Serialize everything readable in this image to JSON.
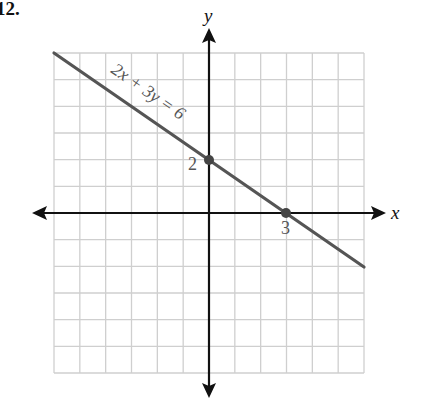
{
  "problem": {
    "number_label": "12."
  },
  "chart_data": {
    "type": "line",
    "title": "",
    "xlabel": "x",
    "ylabel": "y",
    "xlim": [
      -6,
      6
    ],
    "ylim": [
      -6,
      6
    ],
    "grid": true,
    "grid_step": 1,
    "equation": "2x + 3y = 6",
    "series": [
      {
        "name": "2x + 3y = 6",
        "x": [
          -6,
          6
        ],
        "y": [
          6,
          -2
        ]
      }
    ],
    "points": [
      {
        "x": 0,
        "y": 2,
        "label": "2"
      },
      {
        "x": 3,
        "y": 0,
        "label": "3"
      }
    ],
    "annotations": [
      "2x + 3y = 6",
      "2",
      "3"
    ],
    "colors": {
      "line": "#555555",
      "grid": "#cccccc",
      "axes": "#111111"
    }
  }
}
